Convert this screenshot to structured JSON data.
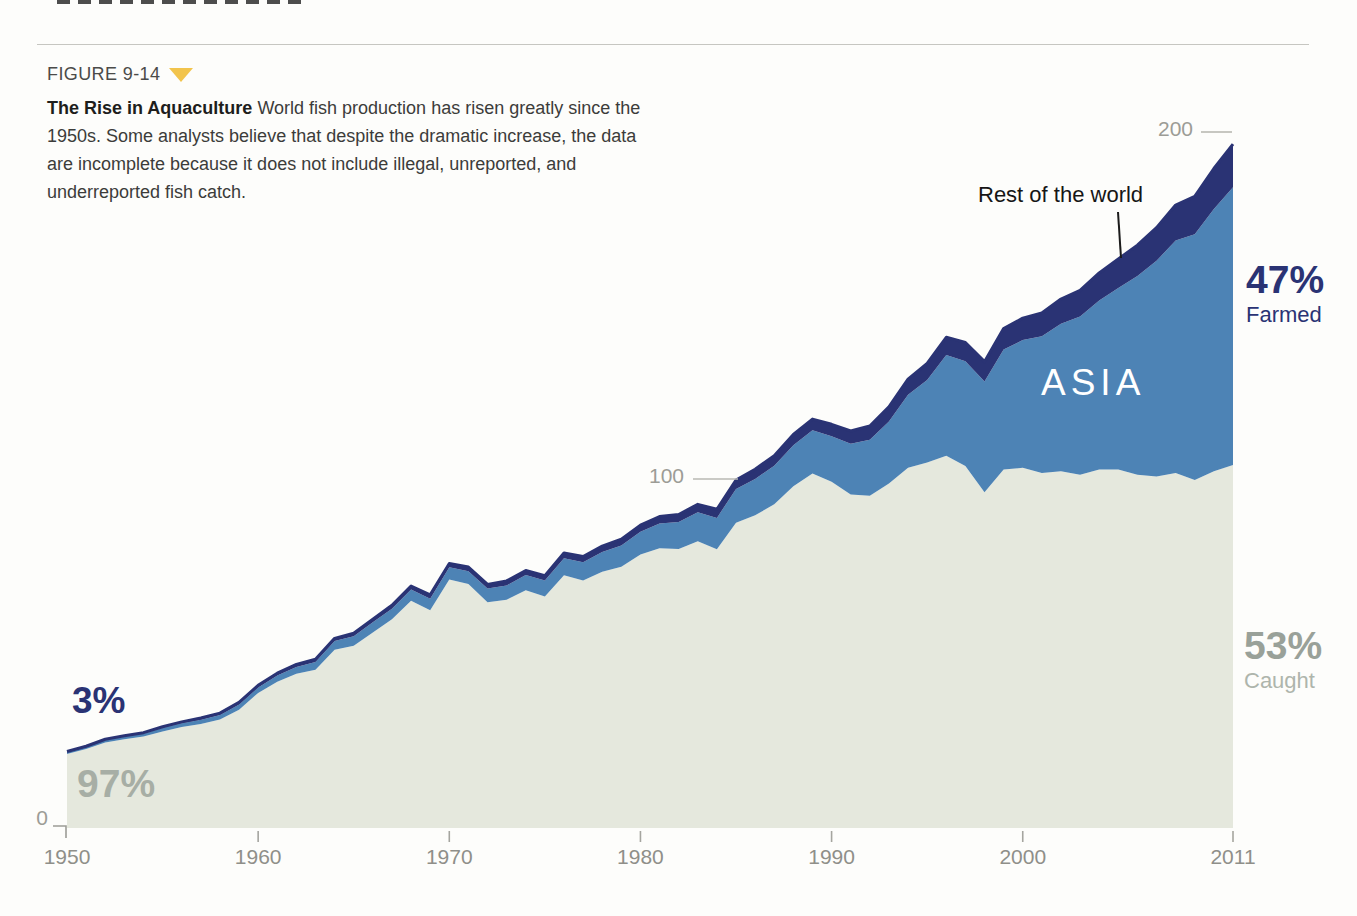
{
  "figure": {
    "label": "FIGURE 9-14"
  },
  "caption": {
    "title": "The Rise in Aquaculture",
    "text": " World fish production has risen greatly since the 1950s. Some analysts believe that despite the dramatic increase, the data are incomplete because it does not include illegal, unreported, and underreported fish catch."
  },
  "colors": {
    "caught_fill": "#e5e8dd",
    "asia_fill": "#4d83b5",
    "farmed_navy": "#2a3374",
    "accent_yellow": "#f2c44c",
    "axis_gray": "#9c9c96",
    "caught_label_gray": "#99a199"
  },
  "chart_data": {
    "type": "area",
    "stacked": true,
    "title": "The Rise in Aquaculture",
    "xlabel": "",
    "ylabel": "",
    "x_range": [
      1950,
      2011
    ],
    "x_step": 1,
    "ylim": [
      0,
      210
    ],
    "x_ticks": [
      "1950",
      "1960",
      "1970",
      "1980",
      "1990",
      "2000",
      "2011"
    ],
    "y_ticks": [
      "0",
      "100",
      "200"
    ],
    "grid": "dash-marks-only",
    "legend_position": "in-plot-annotations",
    "series": [
      {
        "id": "caught",
        "name": "Caught",
        "color": "#e5e8dd",
        "values": [
          21.3,
          22.7,
          24.6,
          25.5,
          26.3,
          27.7,
          29.0,
          29.9,
          31.2,
          34.0,
          38.8,
          42.0,
          44.3,
          45.5,
          51.2,
          52.4,
          56.2,
          60.0,
          65.3,
          62.6,
          71.4,
          70.1,
          64.9,
          65.6,
          68.3,
          66.5,
          72.6,
          71.1,
          73.6,
          75.1,
          78.6,
          80.4,
          80.2,
          82.4,
          80.1,
          87.7,
          89.9,
          93.0,
          98.2,
          101.9,
          99.5,
          95.8,
          95.5,
          99.0,
          103.5,
          105.0,
          107.0,
          104.0,
          96.5,
          103.0,
          103.5,
          102.0,
          102.5,
          101.5,
          103.0,
          103.0,
          101.5,
          101.0,
          102.0,
          100.0,
          102.5,
          104.3
        ]
      },
      {
        "id": "asia-farmed",
        "name": "Farmed - Asia",
        "color": "#4d83b5",
        "values": [
          0.5,
          0.6,
          0.6,
          0.7,
          0.8,
          1.0,
          1.1,
          1.2,
          1.3,
          1.5,
          1.6,
          1.8,
          2.0,
          2.2,
          2.5,
          2.7,
          2.9,
          3.0,
          3.2,
          3.3,
          3.5,
          3.7,
          3.9,
          4.1,
          4.4,
          4.6,
          4.9,
          5.3,
          5.7,
          6.1,
          6.5,
          7.1,
          7.7,
          8.3,
          9.0,
          9.7,
          10.4,
          11.1,
          11.8,
          12.4,
          13.1,
          14.6,
          16.1,
          17.8,
          21.0,
          23.7,
          28.9,
          30.1,
          31.8,
          34.5,
          36.7,
          39.3,
          42.4,
          45.5,
          48.6,
          52.2,
          57.1,
          62.0,
          66.8,
          70.6,
          75.4,
          79.8
        ]
      },
      {
        "id": "rest-of-world-farmed",
        "name": "Farmed - Rest of the world",
        "color": "#2a3374",
        "values": [
          0.2,
          0.2,
          0.3,
          0.3,
          0.3,
          0.4,
          0.4,
          0.5,
          0.5,
          0.6,
          0.6,
          0.7,
          0.7,
          0.8,
          0.8,
          0.9,
          0.9,
          1.0,
          1.0,
          1.1,
          1.1,
          1.2,
          1.2,
          1.3,
          1.3,
          1.4,
          1.5,
          1.6,
          1.7,
          1.8,
          1.9,
          2.0,
          2.2,
          2.3,
          2.5,
          2.6,
          2.8,
          2.9,
          3.1,
          3.2,
          3.4,
          3.7,
          3.9,
          4.2,
          4.5,
          4.8,
          5.1,
          5.4,
          5.7,
          6.0,
          6.3,
          6.7,
          7.1,
          7.5,
          7.9,
          8.3,
          8.9,
          9.5,
          10.2,
          10.9,
          11.6,
          12.4
        ]
      }
    ],
    "annotations": {
      "rest_of_world": "Rest of the world",
      "asia": "ASIA",
      "farmed_pct": "47%",
      "farmed_label": "Farmed",
      "caught_pct": "53%",
      "caught_label": "Caught",
      "initial_farmed_pct": "3%",
      "initial_caught_pct": "97%"
    }
  }
}
